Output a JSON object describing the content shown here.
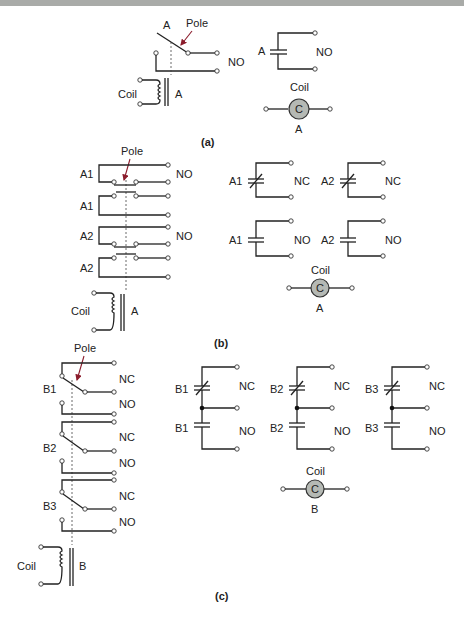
{
  "figure": {
    "panels": [
      {
        "caption": "(a)",
        "relay": {
          "contact_label": "A",
          "pole_label": "Pole",
          "contact_type": "NO",
          "coil_label": "Coil",
          "coil_core_label": "A"
        },
        "schematic_symbols": [
          {
            "label": "A",
            "type": "NO"
          }
        ],
        "coil_symbol": {
          "title": "Coil",
          "letter": "C",
          "label": "A"
        }
      },
      {
        "caption": "(b)",
        "relay": {
          "pole_label": "Pole",
          "contacts": [
            {
              "label": "A1",
              "type": "NO"
            },
            {
              "label": "A1",
              "type": ""
            },
            {
              "label": "A2",
              "type": "NO"
            },
            {
              "label": "A2",
              "type": ""
            }
          ],
          "coil_label": "Coil",
          "coil_core_label": "A"
        },
        "schematic_symbols": [
          {
            "label": "A1",
            "type": "NC"
          },
          {
            "label": "A2",
            "type": "NC"
          },
          {
            "label": "A1",
            "type": "NO"
          },
          {
            "label": "A2",
            "type": "NO"
          }
        ],
        "coil_symbol": {
          "title": "Coil",
          "letter": "C",
          "label": "A"
        }
      },
      {
        "caption": "(c)",
        "relay": {
          "pole_label": "Pole",
          "contacts": [
            {
              "label": "B1",
              "nc": "NC",
              "no": "NO"
            },
            {
              "label": "B2",
              "nc": "NC",
              "no": "NO"
            },
            {
              "label": "B3",
              "nc": "NC",
              "no": "NO"
            }
          ],
          "coil_label": "Coil",
          "coil_core_label": "B"
        },
        "schematic_symbols": [
          {
            "label_nc": "B1",
            "nc": "NC",
            "label_no": "B1",
            "no": "NO"
          },
          {
            "label_nc": "B2",
            "nc": "NC",
            "label_no": "B2",
            "no": "NO"
          },
          {
            "label_nc": "B3",
            "nc": "NC",
            "label_no": "B3",
            "no": "NO"
          }
        ],
        "coil_symbol": {
          "title": "Coil",
          "letter": "C",
          "label": "B"
        }
      }
    ],
    "colors": {
      "line": "#222222",
      "pole_arrow": "#8b1c2c",
      "coil_fill": "#b5b9b4",
      "top_bar": "#a9aba8"
    }
  }
}
